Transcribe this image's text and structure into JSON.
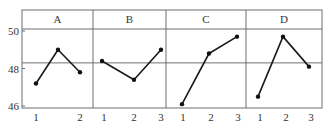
{
  "chart_data": {
    "type": "line",
    "title": "",
    "xlabel": "",
    "ylabel": "",
    "layout": "faceted main-effects plot, 4 panels side by side, shared y-axis",
    "ylim": [
      45.9,
      51.1
    ],
    "yticks": [
      46,
      48,
      50
    ],
    "ytick_labels": [
      "46",
      "48",
      "50"
    ],
    "reference_line": 48.3,
    "grid": false,
    "legend": null,
    "panels": [
      {
        "factor": "A",
        "x_labels": [
          "1",
          "",
          "2"
        ],
        "values": [
          47.2,
          49.0,
          47.8
        ]
      },
      {
        "factor": "B",
        "x_labels": [
          "1",
          "2",
          "3"
        ],
        "values": [
          48.4,
          47.4,
          49.0
        ]
      },
      {
        "factor": "C",
        "x_labels": [
          "1",
          "2",
          "3"
        ],
        "values": [
          46.1,
          48.8,
          49.7
        ]
      },
      {
        "factor": "D",
        "x_labels": [
          "1",
          "2",
          "3"
        ],
        "values": [
          46.5,
          49.7,
          48.1
        ]
      }
    ]
  },
  "colors": {
    "line": "#1a1a1a",
    "frame": "#6f6f6f",
    "text": "#333333"
  }
}
